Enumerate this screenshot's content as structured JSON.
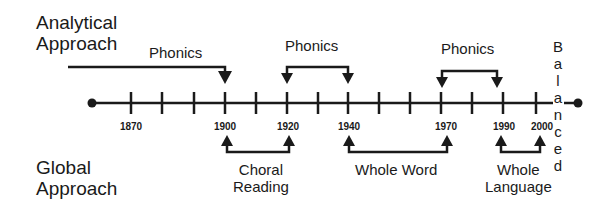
{
  "diagram": {
    "top_label": [
      "Analytical",
      "Approach"
    ],
    "bottom_label": [
      "Global",
      "Approach"
    ],
    "end_label": "Balanced",
    "timeline": {
      "ticks_x": [
        131,
        162,
        194,
        225,
        256,
        287,
        318,
        348,
        379,
        410,
        441,
        472,
        503,
        536
      ],
      "years": [
        {
          "label": "1870",
          "x": 131
        },
        {
          "label": "1900",
          "x": 225
        },
        {
          "label": "1920",
          "x": 287
        },
        {
          "label": "1940",
          "x": 348
        },
        {
          "label": "1970",
          "x": 441
        },
        {
          "label": "1990",
          "x": 503
        },
        {
          "label": "2000",
          "x": 536
        }
      ]
    },
    "analytical_eras": [
      {
        "label": "Phonics",
        "from": "start",
        "to": "1900"
      },
      {
        "label": "Phonics",
        "from": "1920",
        "to": "1940"
      },
      {
        "label": "Phonics",
        "from": "1970",
        "to": "1990"
      }
    ],
    "global_eras": [
      {
        "label_lines": [
          "Choral",
          "Reading"
        ],
        "from": "1900",
        "to": "1920"
      },
      {
        "label_lines": [
          "Whole Word"
        ],
        "from": "1940",
        "to": "1970"
      },
      {
        "label_lines": [
          "Whole",
          "Language"
        ],
        "from": "1990",
        "to": "2000"
      }
    ]
  }
}
